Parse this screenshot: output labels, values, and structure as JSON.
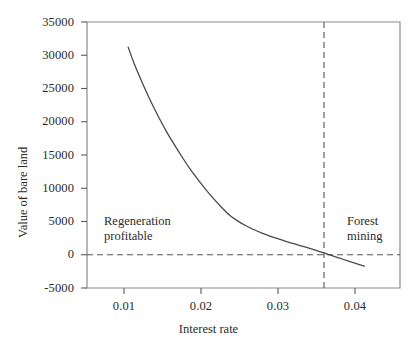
{
  "chart_data": {
    "type": "line",
    "title": "",
    "xlabel": "Interest rate",
    "ylabel": "Value of bare land",
    "xlim": [
      0.005,
      0.0445
    ],
    "ylim": [
      -5000,
      35000
    ],
    "xticks": [
      0.01,
      0.02,
      0.03,
      0.04
    ],
    "xtick_labels": [
      "0.01",
      "0.02",
      "0.03",
      "0.04"
    ],
    "yticks": [
      -5000,
      0,
      5000,
      10000,
      15000,
      20000,
      25000,
      30000,
      35000
    ],
    "ytick_labels": [
      "-5000",
      "0",
      "5000",
      "10000",
      "15000",
      "20000",
      "25000",
      "30000",
      "35000"
    ],
    "grid": false,
    "legend": null,
    "series": [
      {
        "name": "Value of bare land vs interest rate",
        "color": "#4a4a4a",
        "style": "solid",
        "x": [
          0.0102,
          0.011,
          0.012,
          0.013,
          0.014,
          0.015,
          0.016,
          0.017,
          0.018,
          0.019,
          0.02,
          0.021,
          0.022,
          0.023,
          0.024,
          0.025,
          0.026,
          0.027,
          0.028,
          0.029,
          0.03,
          0.031,
          0.032,
          0.033,
          0.034,
          0.035,
          0.0355,
          0.036,
          0.037,
          0.038,
          0.039,
          0.04
        ],
        "y": [
          31200,
          28600,
          25800,
          23200,
          20800,
          18600,
          16600,
          14700,
          12900,
          11300,
          9800,
          8400,
          7100,
          5950,
          5100,
          4400,
          3800,
          3300,
          2850,
          2450,
          2050,
          1700,
          1350,
          1000,
          620,
          230,
          30,
          -170,
          -560,
          -950,
          -1330,
          -1700
        ]
      }
    ],
    "reference_lines": [
      {
        "name": "zero-value-line",
        "orientation": "horizontal",
        "value": 0,
        "style": "dashed",
        "color": "#555555"
      },
      {
        "name": "break-even-interest-rate-line",
        "orientation": "vertical",
        "value": 0.0355,
        "style": "dashed",
        "color": "#555555"
      }
    ],
    "annotations": [
      {
        "name": "regeneration-profitable",
        "lines": [
          "Regeneration",
          "profitable"
        ],
        "x": 0.0135,
        "y": 4000
      },
      {
        "name": "forest-mining",
        "lines": [
          "Forest",
          "mining"
        ],
        "x": 0.0375,
        "y": 4000
      }
    ]
  },
  "axes": {
    "y_label": "Value of bare land",
    "x_label": "Interest rate"
  }
}
